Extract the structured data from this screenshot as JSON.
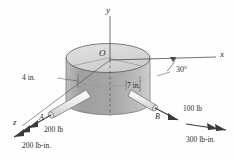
{
  "figure": {
    "background_color": "#fefefe",
    "ink_color": "#2b2b2b",
    "cylinder": {
      "top_face_fill": "#d8d8d8",
      "body_fill": "#a8a8a8",
      "edge_color": "#4a4a4a"
    },
    "rod_fill": "#e8e8e8"
  },
  "axes": {
    "y_label": "y",
    "x_label": "x",
    "z_label": "z",
    "origin_label": "O"
  },
  "points": {
    "a_label": "A",
    "b_label": "B"
  },
  "dimensions": {
    "left_arm": "4 in.",
    "right_arm": "7 in.",
    "angle": "30°"
  },
  "loads": {
    "force_a": "200 lb",
    "force_b": "100 lb",
    "couple_a": "200 lb-in.",
    "couple_b": "300 lb-in."
  }
}
